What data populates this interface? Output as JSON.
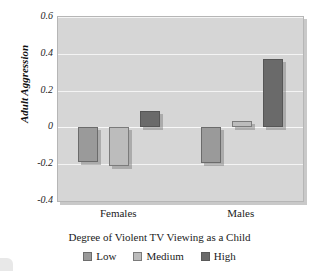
{
  "chart_data": {
    "type": "bar",
    "title": "",
    "xlabel": "Degree of Violent TV Viewing as a Child",
    "ylabel": "Adult Aggression",
    "categories": [
      "Females",
      "Males"
    ],
    "series": [
      {
        "name": "Low",
        "values": [
          -0.19,
          -0.195
        ],
        "color": "#9a9a9a"
      },
      {
        "name": "Medium",
        "values": [
          -0.21,
          0.035
        ],
        "color": "#bcbcbc"
      },
      {
        "name": "High",
        "values": [
          0.09,
          0.37
        ],
        "color": "#6a6a6a"
      }
    ],
    "ylim": [
      -0.4,
      0.6
    ],
    "yticks": [
      "0.6",
      "0.4",
      "0.2",
      "0",
      "-0.2",
      "-0.4"
    ],
    "ytick_values": [
      0.6,
      0.4,
      0.2,
      0,
      -0.2,
      -0.4
    ],
    "grid": true,
    "legend_position": "bottom",
    "plot_background": "#d6d6d6",
    "gridline_color": "#f4f4f4"
  },
  "axis": {
    "y_title": "Adult Aggression",
    "x_categories": [
      "Females",
      "Males"
    ],
    "y_tick_labels": [
      "0.6",
      "0.4",
      "0.2",
      "0",
      "-0.2",
      "-0.4"
    ]
  },
  "caption": {
    "text": "Degree of Violent TV Viewing as a Child"
  },
  "legend": {
    "items": [
      {
        "label": "Low",
        "color": "#9a9a9a"
      },
      {
        "label": "Medium",
        "color": "#bcbcbc"
      },
      {
        "label": "High",
        "color": "#6a6a6a"
      }
    ]
  }
}
